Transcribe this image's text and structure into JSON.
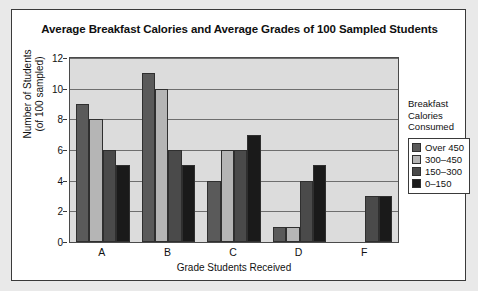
{
  "chart_data": {
    "type": "bar",
    "title": "Average Breakfast Calories and Average Grades of 100 Sampled Students",
    "xlabel": "Grade Students Received",
    "ylabel": "Number of Students (of 100 sampled)",
    "ylabel_line1": "Number of Students",
    "ylabel_line2": "(of 100 sampled)",
    "categories": [
      "A",
      "B",
      "C",
      "D",
      "F"
    ],
    "ylim": [
      0,
      12
    ],
    "yticks": [
      0,
      2,
      4,
      6,
      8,
      10,
      12
    ],
    "grid": true,
    "legend_position": "right",
    "legend_title_lines": [
      "Breakfast",
      "Calories",
      "Consumed"
    ],
    "series": [
      {
        "name": "Over 450",
        "color": "#5a5a5a",
        "values": [
          9,
          11,
          4,
          1,
          0
        ]
      },
      {
        "name": "300–450",
        "color": "#b5b5b5",
        "values": [
          8,
          10,
          6,
          1,
          0
        ]
      },
      {
        "name": "150–300",
        "color": "#4a4a4a",
        "values": [
          6,
          6,
          6,
          4,
          3
        ]
      },
      {
        "name": "0–150",
        "color": "#1a1a1a",
        "values": [
          5,
          5,
          7,
          5,
          3
        ]
      }
    ]
  },
  "colors": {
    "plot_background": "#dcdcdc",
    "card_background": "#ffffff",
    "page_background": "#e9e9e9",
    "gridline": "#6e6e6e",
    "axis": "#3a3a3a",
    "text": "#111111"
  }
}
